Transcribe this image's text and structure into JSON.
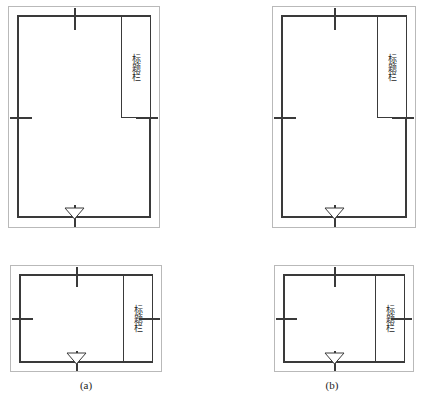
{
  "figure": {
    "title_block_label": "标题栏",
    "captions": [
      {
        "id": "caption-a",
        "text": "(a)"
      },
      {
        "id": "caption-b",
        "text": "(b)"
      }
    ],
    "colors": {
      "trim_line": "#b9b9b9",
      "frame_line": "#3a3a3a",
      "text": "#1d1d1d",
      "paper": "#ffffff"
    },
    "sheets": [
      {
        "id": "sheet-top-left",
        "orientation": "portrait",
        "title_block_position": "upper-right",
        "title_block_label": "标题栏",
        "orientation_mark": "down-triangle",
        "centering_marks": [
          "top",
          "left",
          "right",
          "bottom"
        ]
      },
      {
        "id": "sheet-top-right",
        "orientation": "portrait",
        "title_block_position": "upper-right",
        "title_block_label": "标题栏",
        "orientation_mark": "down-triangle",
        "centering_marks": [
          "top",
          "left",
          "right",
          "bottom"
        ]
      },
      {
        "id": "sheet-bottom-left",
        "orientation": "landscape",
        "title_block_position": "right-full-height",
        "title_block_label": "标题栏",
        "orientation_mark": "down-triangle",
        "centering_marks": [
          "top",
          "left",
          "right",
          "bottom"
        ]
      },
      {
        "id": "sheet-bottom-right",
        "orientation": "landscape",
        "title_block_position": "right-full-height",
        "title_block_label": "标题栏",
        "orientation_mark": "down-triangle",
        "centering_marks": [
          "top",
          "left",
          "right",
          "bottom"
        ]
      }
    ]
  }
}
